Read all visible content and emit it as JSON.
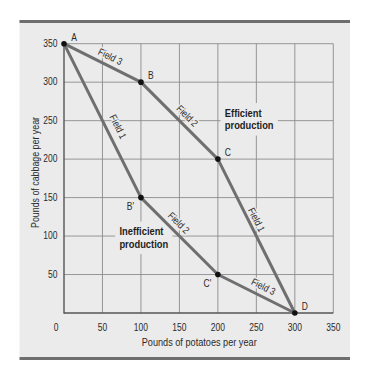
{
  "figure": {
    "background": "#ffffff",
    "panel_color": "#ebebeb",
    "border_color": "#6e6e6e",
    "grid_color": "#8c8c8c",
    "axis_color": "#555555",
    "curve_color": "#6f6f6f",
    "point_color": "#111111"
  },
  "chart_data": {
    "type": "line",
    "title": "",
    "xlabel": "Pounds of potatoes per year",
    "ylabel": "Pounds of cabbage per year",
    "xlim": [
      0,
      350
    ],
    "ylim": [
      0,
      350
    ],
    "xticks": [
      0,
      50,
      100,
      150,
      200,
      250,
      300,
      350
    ],
    "yticks": [
      50,
      100,
      150,
      200,
      250,
      300,
      350
    ],
    "grid": true,
    "legend": null,
    "points": [
      {
        "label": "A",
        "x": 0,
        "y": 350,
        "label_pos": "ne"
      },
      {
        "label": "B",
        "x": 100,
        "y": 300,
        "label_pos": "ne"
      },
      {
        "label": "C",
        "x": 200,
        "y": 200,
        "label_pos": "ne"
      },
      {
        "label": "D",
        "x": 300,
        "y": 0,
        "label_pos": "ne"
      },
      {
        "label": "B'",
        "x": 100,
        "y": 150,
        "label_pos": "sw"
      },
      {
        "label": "C'",
        "x": 200,
        "y": 50,
        "label_pos": "sw"
      }
    ],
    "series": [
      {
        "name": "Efficient production",
        "path": [
          "A",
          "B",
          "C",
          "D"
        ],
        "x": [
          0,
          100,
          200,
          300
        ],
        "y": [
          350,
          300,
          200,
          0
        ],
        "segments": [
          {
            "label": "Field 3",
            "at": [
              60,
              333
            ]
          },
          {
            "label": "Field 2",
            "at": [
              160,
              256
            ]
          },
          {
            "label": "Field 1",
            "at": [
              250,
              121
            ]
          }
        ]
      },
      {
        "name": "Inefficient production",
        "path": [
          "A",
          "B'",
          "C'",
          "D"
        ],
        "x": [
          0,
          100,
          200,
          300
        ],
        "y": [
          350,
          150,
          50,
          0
        ],
        "segments": [
          {
            "label": "Field 1",
            "at": [
              70,
              242
            ]
          },
          {
            "label": "Field 2",
            "at": [
              149,
              117
            ]
          },
          {
            "label": "Field 3",
            "at": [
              259,
              34
            ]
          }
        ]
      }
    ],
    "annotations": [
      {
        "lines": [
          "Efficient",
          "production"
        ],
        "x": 209,
        "y": 260
      },
      {
        "lines": [
          "Inefficient",
          "production"
        ],
        "x": 72,
        "y": 106
      }
    ]
  }
}
